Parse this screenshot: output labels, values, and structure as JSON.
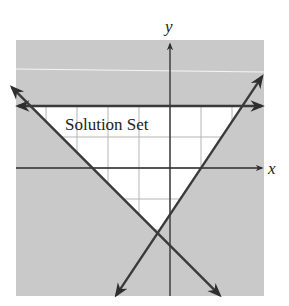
{
  "figure": {
    "x_axis_label": "x",
    "y_axis_label": "y",
    "region_label": "Solution Set",
    "colors": {
      "shaded": "#c9c9c9",
      "solution": "#ffffff",
      "grid": "#b8b8b8",
      "lines": "#3a3a3a",
      "axes": "#2a2a2a"
    },
    "grid_units": {
      "x_range": [
        -5,
        3
      ],
      "y_range": [
        -4,
        4
      ]
    },
    "boundary_lines": [
      {
        "name": "horizontal-boundary",
        "kind": "horizontal",
        "y": 2
      },
      {
        "name": "descending-boundary",
        "kind": "slanted",
        "x_intercept": -2.5,
        "slope": -1
      },
      {
        "name": "ascending-boundary",
        "kind": "slanted",
        "x_intercept": 1,
        "slope": 1.5
      }
    ]
  }
}
